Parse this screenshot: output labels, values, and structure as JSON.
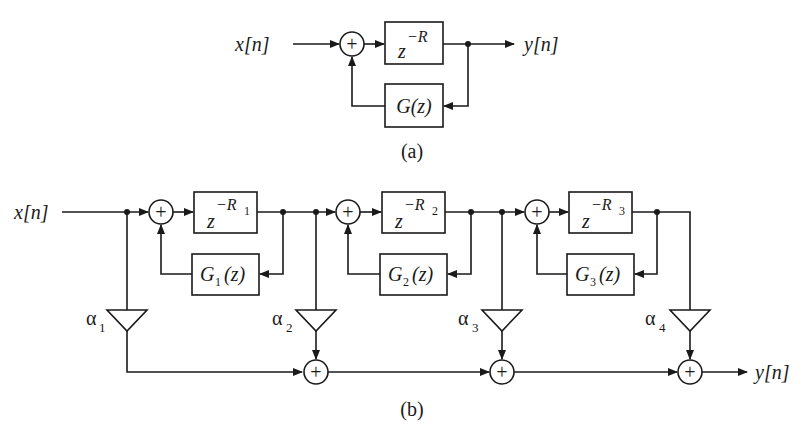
{
  "diagram_a": {
    "input_label": "x[n]",
    "output_label": "y[n]",
    "delay_block": {
      "base": "z",
      "exponent": "−R"
    },
    "feedback_block": {
      "label": "G(z)"
    },
    "caption": "(a)"
  },
  "diagram_b": {
    "input_label": "x[n]",
    "output_label": "y[n]",
    "stages": [
      {
        "delay_base": "z",
        "delay_exp": "−R",
        "delay_sub": "1",
        "filter_name": "G",
        "filter_sub": "1",
        "filter_arg": "(z)"
      },
      {
        "delay_base": "z",
        "delay_exp": "−R",
        "delay_sub": "2",
        "filter_name": "G",
        "filter_sub": "2",
        "filter_arg": "(z)"
      },
      {
        "delay_base": "z",
        "delay_exp": "−R",
        "delay_sub": "3",
        "filter_name": "G",
        "filter_sub": "3",
        "filter_arg": "(z)"
      }
    ],
    "gains": [
      {
        "symbol": "α",
        "sub": "1"
      },
      {
        "symbol": "α",
        "sub": "2"
      },
      {
        "symbol": "α",
        "sub": "3"
      },
      {
        "symbol": "α",
        "sub": "4"
      }
    ],
    "caption": "(b)"
  },
  "symbols": {
    "plus": "+"
  }
}
